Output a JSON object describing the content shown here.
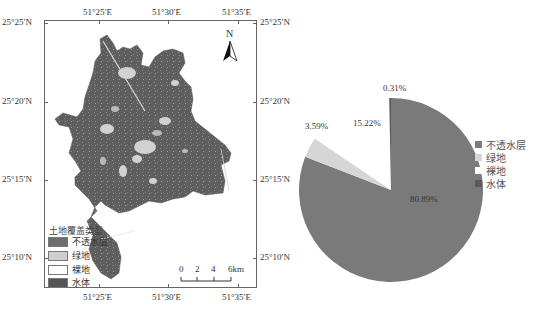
{
  "map": {
    "top_axis_labels": [
      "51°25′E",
      "51°30′E",
      "51°35′E"
    ],
    "bottom_axis_labels": [
      "51°25′E",
      "51°30′E",
      "51°35′E"
    ],
    "left_axis_labels": [
      "25°25′N",
      "25°20′N",
      "25°15′N",
      "25°10′N"
    ],
    "right_axis_labels": [
      "25°25′N",
      "25°20′N",
      "25°15′N",
      "25°10′N"
    ],
    "north_arrow": {
      "label": "N",
      "icon": "north-arrow-icon"
    },
    "scale_bar": {
      "ticks": [
        "0",
        "2",
        "4",
        "6km"
      ]
    },
    "legend": {
      "title": "土地覆盖类型",
      "items": [
        {
          "label": "不透水层",
          "color": "#6e6e6e"
        },
        {
          "label": "绿地",
          "color": "#cfcfcf"
        },
        {
          "label": "裸地",
          "color": "#ffffff"
        },
        {
          "label": "水体",
          "color": "#555555"
        }
      ]
    }
  },
  "pie": {
    "labels": {
      "impervious": "80.89%",
      "green": "3.59%",
      "bare": "15.22%",
      "water": "0.31%"
    },
    "legend": [
      {
        "label": "不透水层",
        "color": "#7a7a7a"
      },
      {
        "label": "绿地",
        "color": "#d6d6d6"
      },
      {
        "label": "裸地",
        "color": "#ffffff"
      },
      {
        "label": "水体",
        "color": "#5a5a5a"
      }
    ]
  },
  "chart_data": [
    {
      "type": "pie",
      "title": "",
      "categories": [
        "不透水层",
        "绿地",
        "裸地",
        "水体"
      ],
      "values": [
        80.89,
        3.59,
        15.22,
        0.31
      ],
      "value_labels": [
        "80.89%",
        "3.59%",
        "15.22%",
        "0.31%"
      ],
      "colors": [
        "#7a7a7a",
        "#d6d6d6",
        "#ffffff",
        "#5a5a5a"
      ],
      "legend_position": "right"
    },
    {
      "type": "map",
      "title": "",
      "legend_title": "土地覆盖类型",
      "legend_entries": [
        "不透水层",
        "绿地",
        "裸地",
        "水体"
      ],
      "x_ticks": [
        "51°25′E",
        "51°30′E",
        "51°35′E"
      ],
      "y_ticks": [
        "25°25′N",
        "25°20′N",
        "25°15′N",
        "25°10′N"
      ],
      "scale_bar": [
        "0",
        "2",
        "4",
        "6km"
      ],
      "north_arrow": true
    }
  ]
}
